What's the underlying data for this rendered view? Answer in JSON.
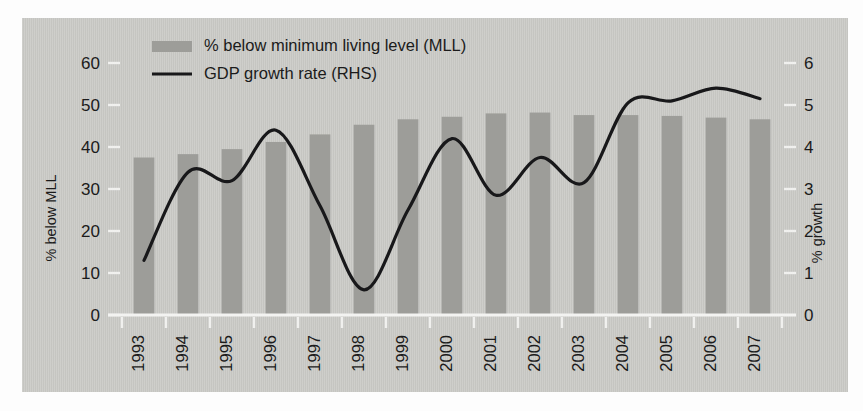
{
  "chart_data": {
    "type": "bar",
    "title": "",
    "subtitle": "",
    "xlabel": "",
    "ylabel": "% below MLL",
    "y2label": "% growth",
    "categories": [
      "1993",
      "1994",
      "1995",
      "1996",
      "1997",
      "1998",
      "1999",
      "2000",
      "2001",
      "2002",
      "2003",
      "2004",
      "2005",
      "2006",
      "2007"
    ],
    "ylim": [
      0,
      60
    ],
    "yticks": [
      0,
      10,
      20,
      30,
      40,
      50,
      60
    ],
    "y2lim": [
      0,
      6
    ],
    "y2ticks": [
      0,
      1,
      2,
      3,
      4,
      5,
      6
    ],
    "grid": false,
    "legend_position": "top-center",
    "series": [
      {
        "name": "% below minimum living level (MLL)",
        "type": "bar",
        "axis": "left",
        "color": "#9d9d99",
        "values": [
          37.5,
          38.3,
          39.5,
          41.2,
          43.0,
          45.3,
          46.6,
          47.2,
          48.0,
          48.2,
          47.6,
          47.6,
          47.4,
          47.0,
          46.6
        ]
      },
      {
        "name": "GDP growth rate (RHS)",
        "type": "line",
        "axis": "right",
        "color": "#18181a",
        "values": [
          1.3,
          3.4,
          3.2,
          4.4,
          2.6,
          0.6,
          2.5,
          4.2,
          2.85,
          3.75,
          3.15,
          5.05,
          5.1,
          5.4,
          5.15
        ]
      }
    ]
  },
  "legend": {
    "items": [
      {
        "label": "% below minimum living level (MLL)",
        "marker": "bar-swatch"
      },
      {
        "label": "GDP growth rate (RHS)",
        "marker": "line-swatch"
      }
    ]
  },
  "axes": {
    "left": {
      "title": "% below MLL",
      "ticks": [
        "0",
        "10",
        "20",
        "30",
        "40",
        "50",
        "60"
      ]
    },
    "right": {
      "title": "% growth",
      "ticks": [
        "0",
        "1",
        "2",
        "3",
        "4",
        "5",
        "6"
      ]
    },
    "bottom": {
      "ticks": [
        "1993",
        "1994",
        "1995",
        "1996",
        "1997",
        "1998",
        "1999",
        "2000",
        "2001",
        "2002",
        "2003",
        "2004",
        "2005",
        "2006",
        "2007"
      ]
    }
  },
  "colors": {
    "panel_background": "#c9c9c5",
    "bar_fill": "#9d9d99",
    "line_stroke": "#18181a",
    "tick_color": "#f0f0ee",
    "text": "#1b1b1b"
  }
}
